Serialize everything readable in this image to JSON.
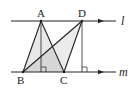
{
  "diagram": {
    "type": "geometry",
    "lines": [
      {
        "name": "l",
        "label": "l",
        "y": 21,
        "x1": 11,
        "x2": 116,
        "arrow_x": 101
      },
      {
        "name": "m",
        "label": "m",
        "y": 72,
        "x1": 11,
        "x2": 116,
        "arrow_x": 101
      }
    ],
    "points": {
      "A": {
        "label": "A",
        "x": 41,
        "y": 21
      },
      "D": {
        "label": "D",
        "x": 82,
        "y": 21
      },
      "B": {
        "label": "B",
        "x": 23,
        "y": 72
      },
      "C": {
        "label": "C",
        "x": 64,
        "y": 72
      }
    },
    "shaded_triangles": [
      "ABC",
      "DBC"
    ],
    "perpendiculars": [
      {
        "from": "A",
        "foot_x": 41
      },
      {
        "from": "D",
        "foot_x": 82
      }
    ],
    "colors": {
      "stroke": "#222222",
      "shade": "#e6e6e6",
      "shade_overlap": "#d4d4d4"
    }
  }
}
